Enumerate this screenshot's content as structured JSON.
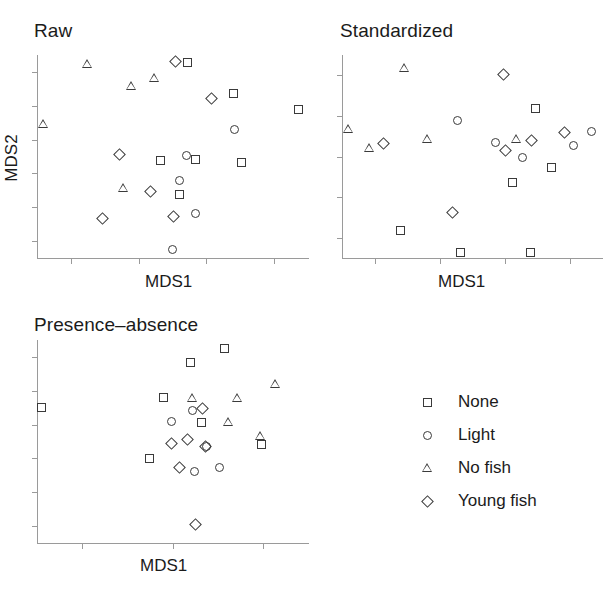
{
  "figure": {
    "symbol_map": {
      "None": "square",
      "Light": "circle",
      "No fish": "triangle",
      "Young fish": "diamond"
    }
  },
  "panels": [
    {
      "id": "raw",
      "title": "Raw",
      "xlabel": "MDS1",
      "ylabel": "MDS2",
      "xticks": 4,
      "yticks": 6
    },
    {
      "id": "standardized",
      "title": "Standardized",
      "xlabel": "MDS1",
      "ylabel": "",
      "xticks": 4,
      "yticks": 5
    },
    {
      "id": "presence_absence",
      "title": "Presence–absence",
      "xlabel": "MDS1",
      "ylabel": "",
      "xticks": 3,
      "yticks": 6
    }
  ],
  "legend": {
    "items": [
      {
        "label": "None",
        "symbol": "square"
      },
      {
        "label": "Light",
        "symbol": "circle"
      },
      {
        "label": "No fish",
        "symbol": "triangle"
      },
      {
        "label": "Young fish",
        "symbol": "diamond"
      }
    ]
  },
  "chart_data": [
    {
      "type": "scatter",
      "id": "raw",
      "title": "Raw",
      "xlabel": "MDS1",
      "ylabel": "MDS2",
      "grid": false,
      "axis_ticks_labeled": false,
      "xlim": [
        0,
        100
      ],
      "ylim": [
        0,
        100
      ],
      "series": [
        {
          "name": "None",
          "symbol": "square",
          "points": [
            [
              55.5,
              96.5
            ],
            [
              72.5,
              81.0
            ],
            [
              96.5,
              73.0
            ],
            [
              45.5,
              48.0
            ],
            [
              58.5,
              48.5
            ],
            [
              75.5,
              47.0
            ],
            [
              52.5,
              31.5
            ]
          ]
        },
        {
          "name": "Light",
          "symbol": "circle",
          "points": [
            [
              73.0,
              63.5
            ],
            [
              55.0,
              50.5
            ],
            [
              52.5,
              38.0
            ],
            [
              58.5,
              22.0
            ],
            [
              50.0,
              4.0
            ]
          ]
        },
        {
          "name": "No fish",
          "symbol": "triangle",
          "points": [
            [
              18.5,
              95.5
            ],
            [
              35.0,
              85.0
            ],
            [
              43.5,
              88.5
            ],
            [
              2.5,
              66.0
            ],
            [
              32.0,
              34.5
            ]
          ]
        },
        {
          "name": "Young fish",
          "symbol": "diamond",
          "points": [
            [
              51.0,
              97.0
            ],
            [
              64.5,
              78.5
            ],
            [
              30.5,
              51.0
            ],
            [
              42.0,
              33.0
            ],
            [
              24.0,
              19.5
            ],
            [
              50.5,
              20.5
            ]
          ]
        }
      ]
    },
    {
      "type": "scatter",
      "id": "standardized",
      "title": "Standardized",
      "xlabel": "MDS1",
      "ylabel": "",
      "grid": false,
      "axis_ticks_labeled": false,
      "xlim": [
        0,
        100
      ],
      "ylim": [
        0,
        100
      ],
      "series": [
        {
          "name": "None",
          "symbol": "square",
          "points": [
            [
              74.5,
              73.5
            ],
            [
              80.5,
              44.5
            ],
            [
              65.5,
              37.0
            ],
            [
              22.5,
              13.5
            ],
            [
              45.5,
              2.5
            ],
            [
              72.5,
              2.5
            ]
          ]
        },
        {
          "name": "Light",
          "symbol": "circle",
          "points": [
            [
              44.5,
              68.0
            ],
            [
              59.0,
              57.0
            ],
            [
              69.5,
              49.5
            ],
            [
              89.0,
              55.5
            ],
            [
              96.0,
              62.5
            ]
          ]
        },
        {
          "name": "No fish",
          "symbol": "triangle",
          "points": [
            [
              24.0,
              93.5
            ],
            [
              2.5,
              63.5
            ],
            [
              10.5,
              54.0
            ],
            [
              33.0,
              58.5
            ],
            [
              67.0,
              58.5
            ]
          ]
        },
        {
          "name": "Young fish",
          "symbol": "diamond",
          "points": [
            [
              62.0,
              90.5
            ],
            [
              16.0,
              56.5
            ],
            [
              63.0,
              53.0
            ],
            [
              73.0,
              58.0
            ],
            [
              85.5,
              62.0
            ],
            [
              42.5,
              22.5
            ]
          ]
        }
      ]
    },
    {
      "type": "scatter",
      "id": "presence_absence",
      "title": "Presence–absence",
      "xlabel": "MDS1",
      "ylabel": "",
      "grid": false,
      "axis_ticks_labeled": false,
      "xlim": [
        0,
        100
      ],
      "ylim": [
        0,
        100
      ],
      "series": [
        {
          "name": "None",
          "symbol": "square",
          "points": [
            [
              69.0,
              96.0
            ],
            [
              56.5,
              89.0
            ],
            [
              46.5,
              71.5
            ],
            [
              1.5,
              67.0
            ],
            [
              60.5,
              59.5
            ],
            [
              83.0,
              48.5
            ],
            [
              41.5,
              41.5
            ]
          ]
        },
        {
          "name": "Light",
          "symbol": "circle",
          "points": [
            [
              57.5,
              65.5
            ],
            [
              49.5,
              60.0
            ],
            [
              62.5,
              47.5
            ],
            [
              58.0,
              35.0
            ],
            [
              67.5,
              37.0
            ]
          ]
        },
        {
          "name": "No fish",
          "symbol": "triangle",
          "points": [
            [
              57.5,
              71.5
            ],
            [
              88.0,
              78.5
            ],
            [
              74.0,
              71.5
            ],
            [
              70.5,
              59.5
            ],
            [
              82.5,
              52.5
            ]
          ]
        },
        {
          "name": "Young fish",
          "symbol": "diamond",
          "points": [
            [
              61.0,
              66.5
            ],
            [
              49.5,
              49.0
            ],
            [
              55.5,
              51.0
            ],
            [
              62.0,
              47.5
            ],
            [
              52.5,
              37.0
            ],
            [
              58.5,
              9.0
            ]
          ]
        }
      ]
    }
  ]
}
